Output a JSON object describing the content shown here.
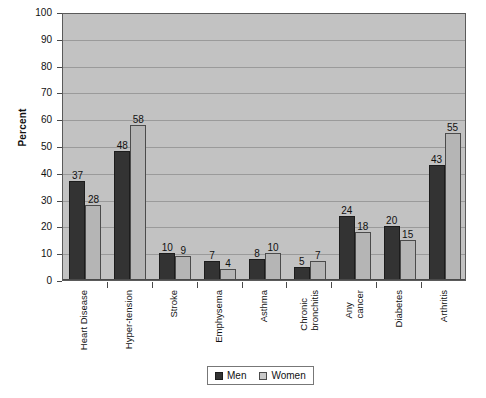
{
  "chart_data": {
    "type": "bar",
    "title": "",
    "xlabel": "",
    "ylabel": "Percent",
    "ylim": [
      0,
      100
    ],
    "ytick_step": 10,
    "yticks": [
      0,
      10,
      20,
      30,
      40,
      50,
      60,
      70,
      80,
      90,
      100
    ],
    "grid": true,
    "legend_position": "bottom-center",
    "categories": [
      "Heart Disease",
      "Hyper-tension",
      "Stroke",
      "Emphysema",
      "Asthma",
      "Chronic bronchitis",
      "Any cancer",
      "Diabetes",
      "Arthritis"
    ],
    "category_lines": [
      [
        "Heart Disease"
      ],
      [
        "Hyper-tension"
      ],
      [
        "Stroke"
      ],
      [
        "Emphysema"
      ],
      [
        "Asthma"
      ],
      [
        "Chronic",
        "bronchitis"
      ],
      [
        "Any",
        "cancer"
      ],
      [
        "Diabetes"
      ],
      [
        "Arthritis"
      ]
    ],
    "series": [
      {
        "name": "Men",
        "color": "#333333",
        "values": [
          37,
          48,
          10,
          7,
          8,
          5,
          24,
          20,
          43
        ]
      },
      {
        "name": "Women",
        "color": "#b5b5b5",
        "values": [
          28,
          58,
          9,
          4,
          10,
          7,
          18,
          15,
          55
        ]
      }
    ]
  },
  "legend": {
    "items": [
      {
        "label": "Men"
      },
      {
        "label": "Women"
      }
    ]
  },
  "colors": {
    "plot_background": "#c2c2c2",
    "men_bar": "#333333",
    "women_bar": "#b5b5b5",
    "gridline": "#9a9a9a",
    "axis": "#4a4a4a",
    "page_background": "#ffffff"
  }
}
